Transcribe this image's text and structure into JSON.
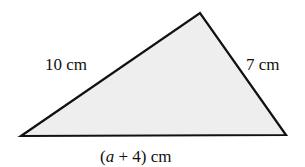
{
  "figure": {
    "shape": "triangle",
    "fill_color": "#eeeeee",
    "stroke_color": "#111111",
    "vertices": {
      "left": [
        21,
        136
      ],
      "top": [
        200,
        13
      ],
      "right": [
        286,
        135
      ]
    },
    "labels": {
      "left_side": "10 cm",
      "right_side": "7 cm",
      "base_open": "(",
      "base_var": "a",
      "base_rest": " + 4) cm"
    }
  }
}
